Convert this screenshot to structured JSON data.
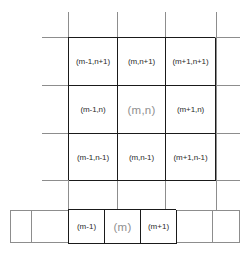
{
  "diagram": {
    "type": "indexed-grid-stencil",
    "grid": {
      "rows": [
        {
          "cells": [
            {
              "label": "(m-1,n+1)",
              "highlight": false
            },
            {
              "label": "(m,n+1)",
              "highlight": false
            },
            {
              "label": "(m+1,n+1)",
              "highlight": false
            }
          ]
        },
        {
          "cells": [
            {
              "label": "(m-1,n)",
              "highlight": false
            },
            {
              "label": "(m,n)",
              "highlight": true
            },
            {
              "label": "(m+1,n)",
              "highlight": false
            }
          ]
        },
        {
          "cells": [
            {
              "label": "(m-1,n-1)",
              "highlight": false
            },
            {
              "label": "(m,n-1)",
              "highlight": false
            },
            {
              "label": "(m+1,n-1)",
              "highlight": false
            }
          ]
        }
      ]
    },
    "strip": {
      "cells": [
        {
          "label": "(m-1)",
          "highlight": false
        },
        {
          "label": "(m)",
          "highlight": true
        },
        {
          "label": "(m+1)",
          "highlight": false
        }
      ]
    },
    "colors": {
      "line_strong": "#1a1a1a",
      "line_thin": "#8d8d8d",
      "label": "#2b2b2b",
      "label_highlight": "#8f8f8f",
      "background": "#ffffff"
    }
  }
}
